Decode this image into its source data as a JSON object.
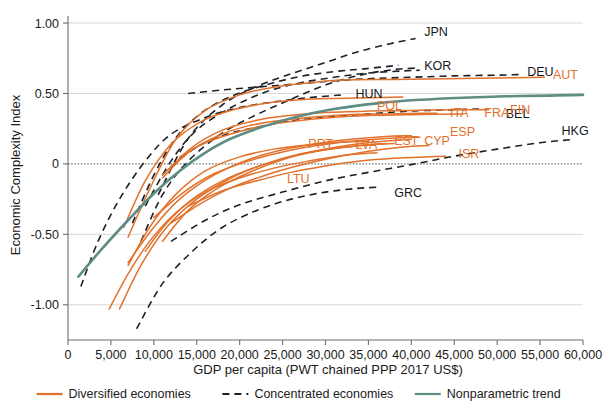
{
  "chart_data": {
    "type": "line",
    "title": "",
    "xlabel": "GDP per capita (PWT chained PPP 2017 US$)",
    "ylabel": "Economic Complexity Index",
    "xlim": [
      0,
      60000
    ],
    "ylim": [
      -1.25,
      1.05
    ],
    "grid": true,
    "legend_position": "bottom",
    "xticks": [
      0,
      5000,
      10000,
      15000,
      20000,
      25000,
      30000,
      35000,
      40000,
      45000,
      50000,
      55000,
      60000
    ],
    "xtick_labels": [
      "0",
      "5,000",
      "10,000",
      "15,000",
      "20,000",
      "25,000",
      "30,000",
      "35,000",
      "40,000",
      "45,000",
      "50,000",
      "55,000",
      "60,000"
    ],
    "yticks": [
      -1.0,
      -0.5,
      0,
      0.5,
      1.0
    ],
    "ytick_labels": [
      "-1.00",
      "-0.50",
      "0",
      "0.50",
      "1.00"
    ],
    "zero_reference_line": 0,
    "legend": [
      {
        "key": "diversified",
        "label": "Diversified economies",
        "color": "#E2712B",
        "style": "solid"
      },
      {
        "key": "concentrated",
        "label": "Concentrated economies",
        "color": "#1d2026",
        "style": "dashed"
      },
      {
        "key": "trend",
        "label": "Nonparametric trend",
        "color": "#5E8D84",
        "style": "solid"
      }
    ],
    "series": [
      {
        "name": "JPN",
        "group": "concentrated",
        "label_x": 41500,
        "label_y": 0.91,
        "points": [
          [
            10500,
            -0.22
          ],
          [
            14000,
            0.18
          ],
          [
            18000,
            0.42
          ],
          [
            22000,
            0.55
          ],
          [
            26000,
            0.64
          ],
          [
            30000,
            0.72
          ],
          [
            34000,
            0.8
          ],
          [
            38000,
            0.86
          ],
          [
            40500,
            0.89
          ]
        ]
      },
      {
        "name": "KOR",
        "group": "concentrated",
        "label_x": 41500,
        "label_y": 0.665,
        "points": [
          [
            8500,
            -0.55
          ],
          [
            11000,
            -0.22
          ],
          [
            14000,
            0.02
          ],
          [
            18000,
            0.22
          ],
          [
            22000,
            0.35
          ],
          [
            26000,
            0.46
          ],
          [
            30000,
            0.56
          ],
          [
            34000,
            0.63
          ],
          [
            38000,
            0.67
          ],
          [
            40500,
            0.68
          ]
        ]
      },
      {
        "name": "DEU",
        "group": "concentrated",
        "label_x": 53500,
        "label_y": 0.625,
        "points": [
          [
            14000,
            0.5
          ],
          [
            18000,
            0.525
          ],
          [
            22000,
            0.545
          ],
          [
            26000,
            0.565
          ],
          [
            30000,
            0.585
          ],
          [
            35000,
            0.605
          ],
          [
            40000,
            0.615
          ],
          [
            45000,
            0.625
          ],
          [
            50000,
            0.63
          ],
          [
            53000,
            0.635
          ]
        ]
      },
      {
        "name": "HUN",
        "group": "concentrated",
        "label_x": 33500,
        "label_y": 0.465,
        "points": [
          [
            7500,
            -0.42
          ],
          [
            10000,
            -0.08
          ],
          [
            12500,
            0.18
          ],
          [
            15500,
            0.36
          ],
          [
            19000,
            0.48
          ],
          [
            23000,
            0.56
          ],
          [
            27000,
            0.62
          ],
          [
            31000,
            0.655
          ],
          [
            34500,
            0.675
          ],
          [
            38500,
            0.7
          ]
        ]
      },
      {
        "name": "CZE",
        "group": "concentrated",
        "label_x": null,
        "label_y": null,
        "points": [
          [
            9000,
            -0.3
          ],
          [
            12000,
            0.02
          ],
          [
            15000,
            0.24
          ],
          [
            19000,
            0.4
          ],
          [
            23000,
            0.51
          ],
          [
            27000,
            0.575
          ],
          [
            31000,
            0.615
          ],
          [
            35000,
            0.645
          ],
          [
            39000,
            0.66
          ],
          [
            41000,
            0.665
          ]
        ]
      },
      {
        "name": "BEL",
        "group": "concentrated",
        "label_x": 51000,
        "label_y": 0.325,
        "points": [
          [
            12000,
            -0.02
          ],
          [
            15000,
            0.12
          ],
          [
            18500,
            0.21
          ],
          [
            22000,
            0.26
          ],
          [
            26000,
            0.305
          ],
          [
            30000,
            0.33
          ],
          [
            35000,
            0.355
          ],
          [
            40000,
            0.375
          ],
          [
            45000,
            0.385
          ],
          [
            48500,
            0.39
          ]
        ]
      },
      {
        "name": "GRC",
        "group": "concentrated",
        "label_x": 38000,
        "label_y": -0.235,
        "points": [
          [
            8000,
            -1.17
          ],
          [
            11000,
            -0.85
          ],
          [
            14500,
            -0.62
          ],
          [
            18000,
            -0.45
          ],
          [
            22000,
            -0.33
          ],
          [
            26000,
            -0.25
          ],
          [
            30000,
            -0.2
          ],
          [
            33500,
            -0.175
          ],
          [
            36000,
            -0.165
          ]
        ]
      },
      {
        "name": "HKG",
        "group": "concentrated",
        "label_x": 57500,
        "label_y": 0.205,
        "points": [
          [
            12000,
            -0.55
          ],
          [
            16000,
            -0.4
          ],
          [
            20000,
            -0.29
          ],
          [
            25000,
            -0.2
          ],
          [
            30000,
            -0.12
          ],
          [
            35000,
            -0.06
          ],
          [
            40000,
            -0.005
          ],
          [
            45000,
            0.055
          ],
          [
            50000,
            0.105
          ],
          [
            55000,
            0.15
          ],
          [
            59000,
            0.175
          ]
        ]
      },
      {
        "name": "ESTc",
        "group": "concentrated",
        "label_x": null,
        "label_y": null,
        "points": [
          [
            1500,
            -0.87
          ],
          [
            3500,
            -0.55
          ],
          [
            6000,
            -0.25
          ],
          [
            9000,
            0.02
          ],
          [
            12000,
            0.21
          ],
          [
            16000,
            0.33
          ],
          [
            20000,
            0.4
          ],
          [
            24000,
            0.44
          ],
          [
            28000,
            0.47
          ],
          [
            32000,
            0.49
          ]
        ]
      },
      {
        "name": "AUT",
        "group": "diversified",
        "label_x": 56500,
        "label_y": 0.605,
        "points": [
          [
            7000,
            -0.52
          ],
          [
            9500,
            -0.18
          ],
          [
            12500,
            0.17
          ],
          [
            16000,
            0.38
          ],
          [
            20000,
            0.49
          ],
          [
            24000,
            0.545
          ],
          [
            28000,
            0.575
          ],
          [
            32000,
            0.595
          ],
          [
            38000,
            0.6
          ],
          [
            44000,
            0.605
          ],
          [
            50000,
            0.61
          ],
          [
            55500,
            0.615
          ]
        ]
      },
      {
        "name": "POL",
        "group": "diversified",
        "label_x": 36000,
        "label_y": 0.385,
        "points": [
          [
            6500,
            -0.45
          ],
          [
            9000,
            -0.12
          ],
          [
            12000,
            0.14
          ],
          [
            15500,
            0.3
          ],
          [
            19000,
            0.38
          ],
          [
            23000,
            0.43
          ],
          [
            27000,
            0.455
          ],
          [
            31000,
            0.465
          ],
          [
            35000,
            0.47
          ],
          [
            39000,
            0.475
          ]
        ]
      },
      {
        "name": "ITA",
        "group": "diversified",
        "label_x": 44500,
        "label_y": 0.335,
        "points": [
          [
            11000,
            -0.1
          ],
          [
            14000,
            0.08
          ],
          [
            17500,
            0.2
          ],
          [
            21000,
            0.27
          ],
          [
            25000,
            0.31
          ],
          [
            29000,
            0.335
          ],
          [
            33000,
            0.35
          ],
          [
            37000,
            0.355
          ],
          [
            41000,
            0.36
          ],
          [
            43000,
            0.36
          ]
        ]
      },
      {
        "name": "FRA",
        "group": "diversified",
        "label_x": 48500,
        "label_y": 0.335,
        "points": [
          [
            13000,
            0.05
          ],
          [
            16000,
            0.15
          ],
          [
            20000,
            0.23
          ],
          [
            24000,
            0.285
          ],
          [
            28000,
            0.315
          ],
          [
            32000,
            0.335
          ],
          [
            36000,
            0.345
          ],
          [
            41000,
            0.35
          ],
          [
            46000,
            0.355
          ]
        ]
      },
      {
        "name": "FIN",
        "group": "diversified",
        "label_x": 51500,
        "label_y": 0.355,
        "points": [
          [
            11000,
            -0.08
          ],
          [
            14500,
            0.12
          ],
          [
            18000,
            0.24
          ],
          [
            22000,
            0.31
          ],
          [
            26000,
            0.345
          ],
          [
            30000,
            0.365
          ],
          [
            35000,
            0.375
          ],
          [
            40000,
            0.38
          ],
          [
            45000,
            0.385
          ],
          [
            49000,
            0.385
          ]
        ]
      },
      {
        "name": "PRT",
        "group": "diversified",
        "label_x": 28000,
        "label_y": 0.115,
        "points": [
          [
            7000,
            -0.72
          ],
          [
            9500,
            -0.45
          ],
          [
            12500,
            -0.22
          ],
          [
            16000,
            -0.05
          ],
          [
            20000,
            0.05
          ],
          [
            24000,
            0.105
          ],
          [
            28000,
            0.135
          ],
          [
            32000,
            0.155
          ],
          [
            35000,
            0.16
          ]
        ]
      },
      {
        "name": "LVA",
        "group": "diversified",
        "label_x": 33500,
        "label_y": 0.105,
        "points": [
          [
            6000,
            -1.03
          ],
          [
            8500,
            -0.72
          ],
          [
            11500,
            -0.45
          ],
          [
            15000,
            -0.25
          ],
          [
            19000,
            -0.1
          ],
          [
            23000,
            0.0
          ],
          [
            27000,
            0.07
          ],
          [
            31000,
            0.11
          ],
          [
            35000,
            0.135
          ],
          [
            38000,
            0.145
          ]
        ]
      },
      {
        "name": "EST",
        "group": "diversified",
        "label_x": 38000,
        "label_y": 0.135,
        "points": [
          [
            7000,
            -0.7
          ],
          [
            10000,
            -0.45
          ],
          [
            13000,
            -0.25
          ],
          [
            17000,
            -0.08
          ],
          [
            21000,
            0.03
          ],
          [
            25000,
            0.1
          ],
          [
            29000,
            0.145
          ],
          [
            33000,
            0.175
          ],
          [
            37000,
            0.195
          ],
          [
            40000,
            0.2
          ]
        ]
      },
      {
        "name": "CYP",
        "group": "diversified",
        "label_x": 41500,
        "label_y": 0.135,
        "points": [
          [
            12000,
            -0.42
          ],
          [
            15500,
            -0.28
          ],
          [
            19000,
            -0.17
          ],
          [
            23000,
            -0.08
          ],
          [
            27000,
            -0.01
          ],
          [
            31000,
            0.045
          ],
          [
            35000,
            0.09
          ],
          [
            39000,
            0.12
          ],
          [
            42000,
            0.13
          ]
        ]
      },
      {
        "name": "ESP",
        "group": "diversified",
        "label_x": 44500,
        "label_y": 0.195,
        "points": [
          [
            10000,
            -0.38
          ],
          [
            13500,
            -0.2
          ],
          [
            17000,
            -0.07
          ],
          [
            21000,
            0.02
          ],
          [
            25000,
            0.085
          ],
          [
            29000,
            0.13
          ],
          [
            33000,
            0.16
          ],
          [
            37000,
            0.18
          ],
          [
            41000,
            0.19
          ]
        ]
      },
      {
        "name": "ISR",
        "group": "diversified",
        "label_x": 45500,
        "label_y": 0.045,
        "points": [
          [
            14000,
            -0.3
          ],
          [
            18000,
            -0.19
          ],
          [
            22000,
            -0.12
          ],
          [
            26000,
            -0.06
          ],
          [
            30000,
            -0.015
          ],
          [
            34000,
            0.02
          ],
          [
            38000,
            0.04
          ],
          [
            42000,
            0.05
          ],
          [
            44000,
            0.055
          ]
        ]
      },
      {
        "name": "LTU",
        "group": "diversified",
        "label_x": 25500,
        "label_y": -0.135,
        "points": [
          [
            4800,
            -1.03
          ],
          [
            7000,
            -0.78
          ],
          [
            9500,
            -0.55
          ],
          [
            12500,
            -0.35
          ],
          [
            16000,
            -0.2
          ],
          [
            20000,
            -0.1
          ],
          [
            24000,
            -0.03
          ],
          [
            28000,
            0.02
          ],
          [
            32000,
            0.06
          ],
          [
            36000,
            0.08
          ]
        ]
      },
      {
        "name": "SVK",
        "group": "diversified",
        "label_x": null,
        "label_y": null,
        "points": [
          [
            9000,
            -0.62
          ],
          [
            11500,
            -0.42
          ],
          [
            14500,
            -0.25
          ],
          [
            18000,
            -0.12
          ],
          [
            22000,
            -0.02
          ],
          [
            26000,
            0.05
          ],
          [
            30000,
            0.1
          ],
          [
            34000,
            0.13
          ],
          [
            37000,
            0.145
          ]
        ]
      },
      {
        "name": "SVN",
        "group": "diversified",
        "label_x": null,
        "label_y": null,
        "points": [
          [
            11000,
            -0.55
          ],
          [
            14000,
            -0.33
          ],
          [
            17500,
            -0.17
          ],
          [
            21500,
            -0.05
          ],
          [
            25500,
            0.04
          ],
          [
            29500,
            0.1
          ],
          [
            33500,
            0.14
          ],
          [
            37500,
            0.165
          ],
          [
            40000,
            0.175
          ]
        ]
      },
      {
        "name": "Nonparametric trend",
        "group": "trend",
        "label_x": null,
        "label_y": null,
        "points": [
          [
            1200,
            -0.8
          ],
          [
            4000,
            -0.6
          ],
          [
            7000,
            -0.4
          ],
          [
            10000,
            -0.21
          ],
          [
            13000,
            -0.05
          ],
          [
            16000,
            0.08
          ],
          [
            19000,
            0.18
          ],
          [
            23000,
            0.27
          ],
          [
            27000,
            0.34
          ],
          [
            31000,
            0.39
          ],
          [
            36000,
            0.43
          ],
          [
            41000,
            0.455
          ],
          [
            46000,
            0.47
          ],
          [
            51000,
            0.48
          ],
          [
            56000,
            0.485
          ],
          [
            60000,
            0.49
          ]
        ]
      }
    ]
  }
}
